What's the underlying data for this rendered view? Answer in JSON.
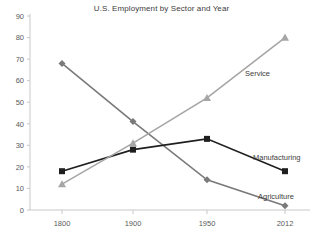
{
  "chart_data": {
    "type": "line",
    "title": "U.S. Employment by Sector and Year",
    "xlabel": "",
    "ylabel": "",
    "categories": [
      "1800",
      "1900",
      "1950",
      "2012"
    ],
    "x_tick_labels": [
      "1800",
      "1900",
      "1950",
      "2012"
    ],
    "y_tick_labels": [
      "0",
      "10",
      "20",
      "30",
      "40",
      "50",
      "60",
      "70",
      "80",
      "90"
    ],
    "ylim": [
      0,
      90
    ],
    "y_tick_step": 10,
    "grid": false,
    "legend_position": "inline-end-labels",
    "series": [
      {
        "name": "Agriculture",
        "values": [
          68,
          41,
          14,
          2
        ],
        "color": "#7a7a7a",
        "marker": "diamond"
      },
      {
        "name": "Manufacturing",
        "values": [
          18,
          28,
          33,
          18
        ],
        "color": "#1f1f1f",
        "marker": "square"
      },
      {
        "name": "Service",
        "values": [
          12,
          31,
          52,
          80
        ],
        "color": "#a6a6a6",
        "marker": "triangle"
      }
    ],
    "annotations": [
      {
        "text": "Service",
        "series": "Service"
      },
      {
        "text": "Manufacturing",
        "series": "Manufacturing"
      },
      {
        "text": "Agriculture",
        "series": "Agriculture"
      }
    ],
    "axis_color": "#c8c8c8"
  }
}
